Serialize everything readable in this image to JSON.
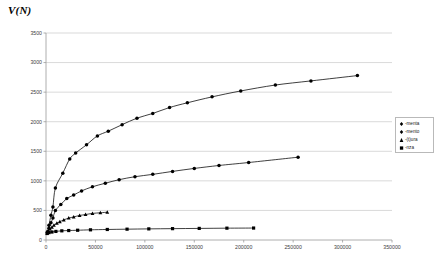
{
  "chart_data": {
    "type": "scatter",
    "title": "V(N)",
    "xlabel": "",
    "ylabel": "",
    "xlim": [
      0,
      350000
    ],
    "ylim": [
      0,
      3500
    ],
    "xticks": [
      0,
      50000,
      100000,
      150000,
      200000,
      250000,
      300000,
      350000
    ],
    "yticks": [
      0,
      500,
      1000,
      1500,
      2000,
      2500,
      3000,
      3500
    ],
    "xtick_labels": [
      "0",
      "50000",
      "100000",
      "150000",
      "200000",
      "250000",
      "300000",
      "350000"
    ],
    "ytick_labels": [
      "0",
      "500",
      "1000",
      "1500",
      "2000",
      "2500",
      "3000",
      "3500"
    ],
    "grid": "horizontal",
    "legend_position": "right",
    "series": [
      {
        "name": "-menta",
        "marker": "diamond",
        "color": "#000000",
        "points": [
          [
            1500,
            140
          ],
          [
            3000,
            250
          ],
          [
            5000,
            420
          ],
          [
            7000,
            560
          ],
          [
            9500,
            880
          ],
          [
            17000,
            1130
          ],
          [
            24000,
            1370
          ],
          [
            30000,
            1470
          ],
          [
            41000,
            1610
          ],
          [
            52000,
            1760
          ],
          [
            63000,
            1840
          ],
          [
            77000,
            1950
          ],
          [
            92000,
            2060
          ],
          [
            108000,
            2140
          ],
          [
            125000,
            2240
          ],
          [
            143000,
            2320
          ],
          [
            168000,
            2420
          ],
          [
            197000,
            2520
          ],
          [
            232000,
            2620
          ],
          [
            268000,
            2690
          ],
          [
            315000,
            2780
          ]
        ]
      },
      {
        "name": "-mento",
        "marker": "diamond",
        "color": "#000000",
        "points": [
          [
            1500,
            130
          ],
          [
            3000,
            200
          ],
          [
            5000,
            290
          ],
          [
            7000,
            370
          ],
          [
            9500,
            500
          ],
          [
            15000,
            600
          ],
          [
            21000,
            700
          ],
          [
            28000,
            760
          ],
          [
            36000,
            830
          ],
          [
            47000,
            900
          ],
          [
            60000,
            960
          ],
          [
            74000,
            1020
          ],
          [
            90000,
            1070
          ],
          [
            108000,
            1110
          ],
          [
            128000,
            1160
          ],
          [
            150000,
            1210
          ],
          [
            175000,
            1260
          ],
          [
            205000,
            1310
          ],
          [
            255000,
            1400
          ]
        ]
      },
      {
        "name": "-(t)ura",
        "marker": "triangle",
        "color": "#000000",
        "points": [
          [
            1200,
            120
          ],
          [
            2500,
            150
          ],
          [
            4000,
            185
          ],
          [
            6000,
            215
          ],
          [
            8000,
            250
          ],
          [
            11000,
            285
          ],
          [
            14000,
            310
          ],
          [
            18000,
            340
          ],
          [
            23000,
            370
          ],
          [
            28000,
            390
          ],
          [
            34000,
            415
          ],
          [
            40000,
            430
          ],
          [
            47000,
            450
          ],
          [
            55000,
            460
          ],
          [
            62000,
            470
          ]
        ]
      },
      {
        "name": "-nza",
        "marker": "square",
        "color": "#000000",
        "points": [
          [
            1200,
            110
          ],
          [
            3000,
            125
          ],
          [
            6000,
            135
          ],
          [
            10000,
            145
          ],
          [
            16000,
            155
          ],
          [
            23000,
            160
          ],
          [
            32000,
            165
          ],
          [
            45000,
            172
          ],
          [
            62000,
            178
          ],
          [
            82000,
            183
          ],
          [
            104000,
            188
          ],
          [
            128000,
            192
          ],
          [
            155000,
            196
          ],
          [
            183000,
            200
          ],
          [
            210000,
            202
          ]
        ]
      }
    ]
  },
  "legend": {
    "items": [
      {
        "label": "-menta",
        "marker": "diamond"
      },
      {
        "label": "-mento",
        "marker": "diamond"
      },
      {
        "label": "-(t)ura",
        "marker": "triangle"
      },
      {
        "label": "-nza",
        "marker": "square"
      }
    ]
  }
}
